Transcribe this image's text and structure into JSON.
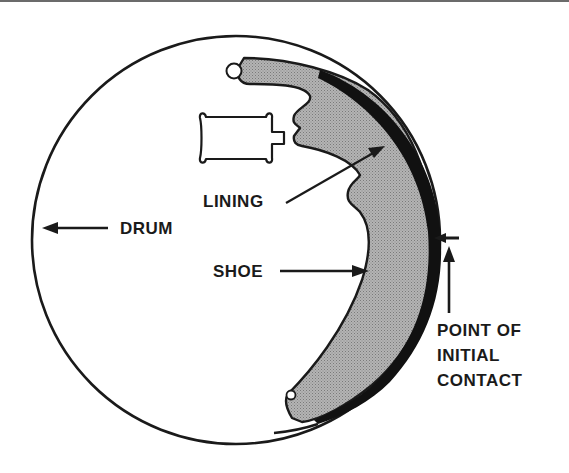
{
  "diagram": {
    "labels": {
      "lining": "LINING",
      "drum": "DRUM",
      "shoe": "SHOE",
      "contact_line1": "POINT OF",
      "contact_line2": "INITIAL",
      "contact_line3": "CONTACT"
    },
    "colors": {
      "ink": "#1a1a1a",
      "shoe_fill": "#a8a8a8",
      "lining_fill": "#111111",
      "background": "#ffffff"
    }
  }
}
